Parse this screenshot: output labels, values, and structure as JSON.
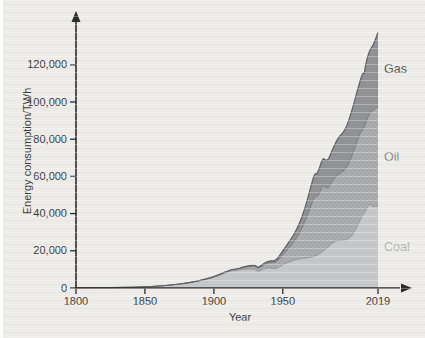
{
  "figure": {
    "background_color": "#edece9",
    "axis_color": "#2b2b2d",
    "tick_label_color": "#3c3c3e"
  },
  "chart_data": {
    "type": "area",
    "stacked": true,
    "title": "",
    "xlabel": "Year",
    "ylabel": "Energy consumption/TWh",
    "x_range": [
      1800,
      2019
    ],
    "y_range": [
      0,
      140000
    ],
    "grid": false,
    "legend_position": "inline-right",
    "x_ticks": [
      {
        "value": 1800,
        "label": "1800"
      },
      {
        "value": 1850,
        "label": "1850"
      },
      {
        "value": 1900,
        "label": "1900"
      },
      {
        "value": 1950,
        "label": "1950"
      },
      {
        "value": 2019,
        "label": "2019"
      }
    ],
    "y_ticks": [
      {
        "value": 0,
        "label": "0"
      },
      {
        "value": 20000,
        "label": "20,000"
      },
      {
        "value": 40000,
        "label": "40,000"
      },
      {
        "value": 60000,
        "label": "60,000"
      },
      {
        "value": 80000,
        "label": "80,000"
      },
      {
        "value": 100000,
        "label": "100,000"
      },
      {
        "value": 120000,
        "label": "120,000"
      }
    ],
    "x": [
      1800,
      1810,
      1820,
      1830,
      1840,
      1850,
      1860,
      1870,
      1880,
      1890,
      1900,
      1905,
      1910,
      1913,
      1918,
      1920,
      1925,
      1930,
      1932,
      1935,
      1940,
      1945,
      1950,
      1955,
      1960,
      1965,
      1970,
      1973,
      1975,
      1979,
      1981,
      1983,
      1985,
      1990,
      1995,
      2000,
      2005,
      2008,
      2009,
      2010,
      2013,
      2015,
      2017,
      2019
    ],
    "series_order_bottom_to_top": [
      "Coal",
      "Oil",
      "Gas"
    ],
    "series": [
      {
        "name": "Coal",
        "label": "Coal",
        "color": "#c6c7c8",
        "line_color": "#96979a",
        "label_color": "#b3b4b6",
        "values": [
          97,
          128,
          153,
          264,
          356,
          569,
          1061,
          1642,
          2542,
          3856,
          5728,
          7271,
          8656,
          9333,
          9600,
          9987,
          10255,
          10099,
          8640,
          10024,
          11261,
          10043,
          12603,
          14215,
          15442,
          16023,
          16476,
          17159,
          17560,
          19700,
          20855,
          21935,
          23774,
          25897,
          25551,
          27427,
          34990,
          39575,
          39826,
          41761,
          45448,
          43786,
          43752,
          43849
        ]
      },
      {
        "name": "Oil",
        "label": "Oil",
        "color": "#adaeb0",
        "texture_dot_color": "#9b9c9f",
        "line_color": "#7b7d80",
        "label_color": "#8a8b8d",
        "values": [
          0,
          0,
          0,
          0,
          0,
          0,
          2,
          9,
          33,
          89,
          181,
          250,
          397,
          472,
          603,
          889,
          1305,
          1756,
          1628,
          1980,
          2654,
          3244,
          5444,
          7836,
          11096,
          17990,
          26649,
          32660,
          30878,
          36104,
          32901,
          31711,
          32827,
          35582,
          37383,
          42882,
          46306,
          46543,
          45555,
          47020,
          48766,
          51294,
          52790,
          53620
        ]
      },
      {
        "name": "Gas",
        "label": "Gas",
        "color": "#909295",
        "line_color": "#5d5f62",
        "label_color": "#58595b",
        "values": [
          0,
          0,
          0,
          0,
          0,
          0,
          0,
          0,
          23,
          75,
          64,
          100,
          143,
          168,
          205,
          233,
          330,
          566,
          520,
          620,
          885,
          1100,
          2092,
          3200,
          4708,
          6304,
          10338,
          12130,
          12427,
          14500,
          14750,
          15290,
          16085,
          19484,
          21406,
          24450,
          27542,
          30020,
          29170,
          31883,
          33900,
          34741,
          36704,
          39893
        ]
      }
    ]
  }
}
